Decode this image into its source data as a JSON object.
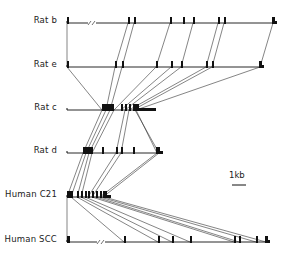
{
  "figure": {
    "ink_color": "#111111",
    "line_color": "#333333",
    "rows": [
      {
        "label": "Rat b",
        "y": 23,
        "start": 67,
        "end": 275,
        "break_x": 89,
        "exons": [
          [
            67,
            2
          ],
          [
            128,
            2
          ],
          [
            134,
            2
          ],
          [
            170,
            2
          ],
          [
            183,
            2
          ],
          [
            193,
            2
          ],
          [
            218,
            2
          ],
          [
            224,
            2
          ]
        ],
        "terminal": {
          "x": 272,
          "w": 3
        }
      },
      {
        "label": "Rat e",
        "y": 67,
        "start": 67,
        "end": 263,
        "exons": [
          [
            67,
            2
          ],
          [
            115,
            2
          ],
          [
            122,
            2
          ],
          [
            156,
            2
          ],
          [
            171,
            2
          ],
          [
            181,
            2
          ],
          [
            206,
            2
          ],
          [
            212,
            2
          ]
        ],
        "terminal": {
          "x": 259,
          "w": 3
        }
      },
      {
        "label": "Rat c",
        "y": 110,
        "start": 67,
        "end": 155,
        "exons": [
          [
            102,
            12
          ],
          [
            121,
            2
          ],
          [
            125,
            2
          ],
          [
            129,
            2
          ],
          [
            133,
            2
          ]
        ],
        "terminal": {
          "x": 135,
          "w": 19,
          "tail": true
        }
      },
      {
        "label": "Rat d",
        "y": 153,
        "start": 67,
        "end": 163,
        "exons": [
          [
            83,
            10
          ],
          [
            102,
            2
          ],
          [
            116,
            2
          ],
          [
            121,
            2
          ],
          [
            133,
            2
          ]
        ],
        "terminal": {
          "x": 156,
          "w": 5
        }
      },
      {
        "label": "Human C21",
        "y": 197,
        "start": 67,
        "end": 110,
        "exons": [
          [
            67,
            6
          ],
          [
            77,
            2
          ],
          [
            81,
            2
          ],
          [
            85,
            2
          ],
          [
            88,
            2
          ],
          [
            92,
            2
          ],
          [
            96,
            2
          ],
          [
            100,
            2
          ]
        ],
        "terminal": {
          "x": 103,
          "w": 6,
          "tail": true
        }
      },
      {
        "label": "Human SCC",
        "y": 242,
        "start": 67,
        "end": 269,
        "break_x": 98,
        "exons": [
          [
            67,
            3
          ],
          [
            124,
            2
          ],
          [
            158,
            2
          ],
          [
            172,
            2
          ],
          [
            190,
            2
          ],
          [
            234,
            2
          ],
          [
            239,
            2
          ],
          [
            256,
            2
          ]
        ],
        "terminal": {
          "x": 265,
          "w": 3
        }
      }
    ],
    "connections": [
      [
        [
          67,
          23
        ],
        [
          67,
          67
        ]
      ],
      [
        [
          128,
          23
        ],
        [
          115,
          67
        ]
      ],
      [
        [
          134,
          23
        ],
        [
          122,
          67
        ]
      ],
      [
        [
          170,
          23
        ],
        [
          156,
          67
        ]
      ],
      [
        [
          193,
          23
        ],
        [
          181,
          67
        ]
      ],
      [
        [
          218,
          23
        ],
        [
          206,
          67
        ]
      ],
      [
        [
          224,
          23
        ],
        [
          212,
          67
        ]
      ],
      [
        [
          273,
          23
        ],
        [
          260,
          67
        ]
      ],
      [
        [
          67,
          67
        ],
        [
          102,
          110
        ]
      ],
      [
        [
          115,
          67
        ],
        [
          106,
          110
        ]
      ],
      [
        [
          122,
          67
        ],
        [
          110,
          110
        ]
      ],
      [
        [
          156,
          67
        ],
        [
          114,
          110
        ]
      ],
      [
        [
          171,
          67
        ],
        [
          121,
          110
        ]
      ],
      [
        [
          181,
          67
        ],
        [
          125,
          110
        ]
      ],
      [
        [
          206,
          67
        ],
        [
          129,
          110
        ]
      ],
      [
        [
          212,
          67
        ],
        [
          133,
          110
        ]
      ],
      [
        [
          260,
          67
        ],
        [
          136,
          110
        ]
      ],
      [
        [
          102,
          110
        ],
        [
          83,
          153
        ]
      ],
      [
        [
          106,
          110
        ],
        [
          86,
          153
        ]
      ],
      [
        [
          110,
          110
        ],
        [
          89,
          153
        ]
      ],
      [
        [
          114,
          110
        ],
        [
          92,
          153
        ]
      ],
      [
        [
          125,
          110
        ],
        [
          116,
          153
        ]
      ],
      [
        [
          129,
          110
        ],
        [
          121,
          153
        ]
      ],
      [
        [
          136,
          110
        ],
        [
          157,
          153
        ]
      ],
      [
        [
          135,
          110
        ],
        [
          159,
          153
        ]
      ],
      [
        [
          83,
          153
        ],
        [
          67,
          197
        ]
      ],
      [
        [
          86,
          153
        ],
        [
          71,
          197
        ]
      ],
      [
        [
          89,
          153
        ],
        [
          77,
          197
        ]
      ],
      [
        [
          92,
          153
        ],
        [
          81,
          197
        ]
      ],
      [
        [
          116,
          153
        ],
        [
          88,
          197
        ]
      ],
      [
        [
          121,
          153
        ],
        [
          92,
          197
        ]
      ],
      [
        [
          157,
          153
        ],
        [
          100,
          197
        ]
      ],
      [
        [
          159,
          153
        ],
        [
          103,
          197
        ]
      ],
      [
        [
          67,
          197
        ],
        [
          67,
          242
        ]
      ],
      [
        [
          71,
          197
        ],
        [
          124,
          242
        ]
      ],
      [
        [
          77,
          197
        ],
        [
          158,
          242
        ]
      ],
      [
        [
          81,
          197
        ],
        [
          172,
          242
        ]
      ],
      [
        [
          85,
          197
        ],
        [
          190,
          242
        ]
      ],
      [
        [
          92,
          197
        ],
        [
          234,
          242
        ]
      ],
      [
        [
          96,
          197
        ],
        [
          239,
          242
        ]
      ],
      [
        [
          100,
          197
        ],
        [
          256,
          242
        ]
      ],
      [
        [
          104,
          197
        ],
        [
          266,
          242
        ]
      ]
    ],
    "scale_bar": {
      "label": "1kb",
      "x1": 232,
      "x2": 246,
      "y": 185,
      "label_x": 229,
      "label_y": 170
    }
  }
}
